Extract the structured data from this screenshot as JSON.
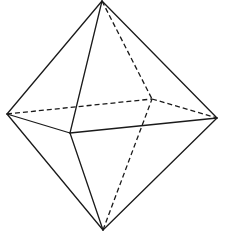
{
  "figure": {
    "title": "",
    "stroke_color": "#1a1a1a",
    "background": "#ffffff",
    "vertices": {
      "top": [
        102,
        1
      ],
      "left": [
        7,
        114
      ],
      "right": [
        217,
        118
      ],
      "front": [
        70,
        133
      ],
      "back": [
        152,
        99
      ],
      "bottom": [
        103,
        230
      ]
    },
    "edges": [
      {
        "from": "top",
        "to": "left",
        "style": "solid"
      },
      {
        "from": "top",
        "to": "right",
        "style": "solid"
      },
      {
        "from": "top",
        "to": "front",
        "style": "solid"
      },
      {
        "from": "top",
        "to": "back",
        "style": "dashed"
      },
      {
        "from": "left",
        "to": "front",
        "style": "solid"
      },
      {
        "from": "front",
        "to": "right",
        "style": "solid"
      },
      {
        "from": "left",
        "to": "back",
        "style": "dashed"
      },
      {
        "from": "back",
        "to": "right",
        "style": "dashed"
      },
      {
        "from": "bottom",
        "to": "left",
        "style": "solid"
      },
      {
        "from": "bottom",
        "to": "right",
        "style": "solid"
      },
      {
        "from": "bottom",
        "to": "front",
        "style": "solid"
      },
      {
        "from": "bottom",
        "to": "back",
        "style": "dashed"
      }
    ]
  }
}
